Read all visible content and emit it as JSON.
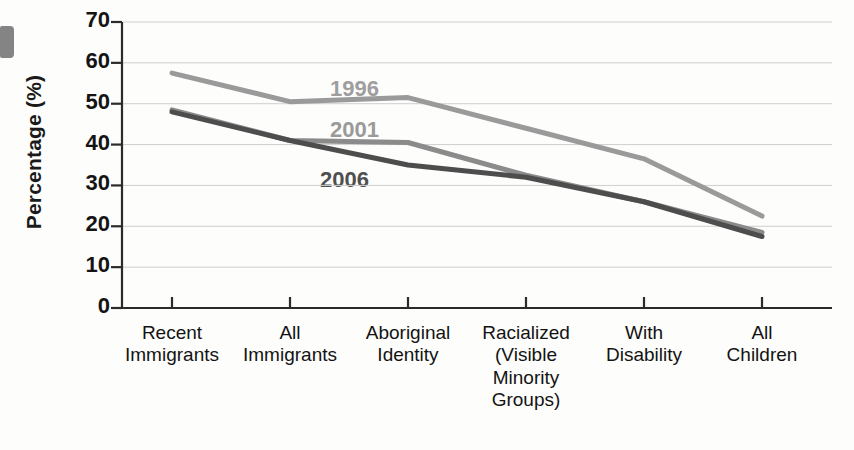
{
  "chart_data": {
    "type": "line",
    "title": "",
    "xlabel": "",
    "ylabel": "Percentage (%)",
    "ylim": [
      0,
      70
    ],
    "ytick_labels": [
      "70",
      "60",
      "50",
      "40",
      "30",
      "20",
      "10",
      "0"
    ],
    "ytick_values": [
      70,
      60,
      50,
      40,
      30,
      20,
      10,
      0
    ],
    "grid": true,
    "legend_position": "inline-annotations",
    "categories": [
      "Recent\nImmigrants",
      "All\nImmigrants",
      "Aboriginal\nIdentity",
      "Racialized\n(Visible\nMinority\nGroups)",
      "With\nDisability",
      "All\nChildren"
    ],
    "series": [
      {
        "name": "1996",
        "color": "#9a9a9a",
        "values": [
          57.5,
          50.5,
          51.5,
          44.0,
          36.5,
          22.5
        ]
      },
      {
        "name": "2001",
        "color": "#8b8b8b",
        "values": [
          48.5,
          41.0,
          40.5,
          32.5,
          26.0,
          18.5
        ]
      },
      {
        "name": "2006",
        "color": "#4d4d4d",
        "values": [
          48.0,
          41.0,
          35.0,
          32.0,
          26.0,
          17.5
        ]
      }
    ],
    "annotations": [
      {
        "text": "1996",
        "color": "#9e9e9e",
        "x_px": 330,
        "y_px": 76
      },
      {
        "text": "2001",
        "color": "#9a9a9a",
        "x_px": 330,
        "y_px": 117
      },
      {
        "text": "2006",
        "color": "#4f4f4f",
        "x_px": 320,
        "y_px": 167
      }
    ]
  }
}
